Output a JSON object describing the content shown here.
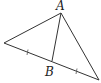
{
  "diagram": {
    "type": "geometry-triangle",
    "labels": {
      "vertex_top": "A",
      "point_on_base": "B"
    },
    "points": {
      "left": [
        4,
        43
      ],
      "A": [
        61,
        13
      ],
      "right": [
        99,
        80
      ],
      "B": [
        52,
        61
      ]
    },
    "segments": [
      "left-A",
      "A-right",
      "left-right",
      "A-B"
    ],
    "tick_marks": [
      "left-B midpoint",
      "B-right midpoint"
    ],
    "colors": {
      "line": "#333333",
      "background": "#ffffff"
    }
  }
}
